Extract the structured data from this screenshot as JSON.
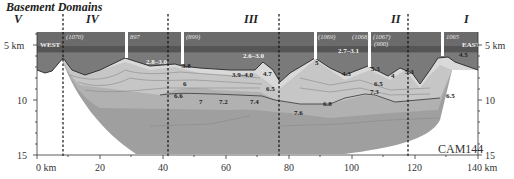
{
  "header": {
    "title": "Basement Domains"
  },
  "domains": [
    {
      "label": "V",
      "x": 18
    },
    {
      "label": "IV",
      "x": 92
    },
    {
      "label": "III",
      "x": 250
    },
    {
      "label": "II",
      "x": 395
    },
    {
      "label": "I",
      "x": 466
    }
  ],
  "boundaries_km": [
    8,
    41,
    76,
    117
  ],
  "side_labels": {
    "west": "WEST",
    "east": "EAST"
  },
  "profile_tag": "CAM144",
  "stations": [
    {
      "label": "(1070)",
      "x_km": 8.5
    },
    {
      "label": "897",
      "x_km": 28
    },
    {
      "label": "(899)",
      "x_km": 46
    },
    {
      "label": "(1069)",
      "x_km": 88
    },
    {
      "label": "(1068)",
      "x_km": 100
    },
    {
      "label": "(1067)",
      "x_km": 108
    },
    {
      "label": "(900)",
      "x_km": 108
    },
    {
      "label": "1065",
      "x_km": 128
    }
  ],
  "velocity_labels": [
    {
      "text": "2.8–3.0",
      "x": 146,
      "y": 64,
      "light": true
    },
    {
      "text": "2.6–3.0",
      "x": 243,
      "y": 58,
      "light": true
    },
    {
      "text": "2.7–3.1",
      "x": 338,
      "y": 53,
      "light": true
    },
    {
      "text": "3.8",
      "x": 182,
      "y": 68
    },
    {
      "text": "3.9–4.0",
      "x": 232,
      "y": 77
    },
    {
      "text": "4.7",
      "x": 263,
      "y": 76
    },
    {
      "text": "5",
      "x": 315,
      "y": 65
    },
    {
      "text": "4.3",
      "x": 342,
      "y": 76
    },
    {
      "text": "5.3",
      "x": 371,
      "y": 71
    },
    {
      "text": "4",
      "x": 391,
      "y": 78
    },
    {
      "text": "5.3",
      "x": 405,
      "y": 74
    },
    {
      "text": "4.5",
      "x": 459,
      "y": 57
    },
    {
      "text": "6",
      "x": 183,
      "y": 86
    },
    {
      "text": "6.6",
      "x": 174,
      "y": 98
    },
    {
      "text": "7",
      "x": 199,
      "y": 104
    },
    {
      "text": "7.2",
      "x": 219,
      "y": 104
    },
    {
      "text": "7.4",
      "x": 250,
      "y": 104
    },
    {
      "text": "6.5",
      "x": 266,
      "y": 91
    },
    {
      "text": "6.5",
      "x": 374,
      "y": 86
    },
    {
      "text": "7.3",
      "x": 370,
      "y": 94
    },
    {
      "text": "6.8",
      "x": 323,
      "y": 106
    },
    {
      "text": "7.6",
      "x": 294,
      "y": 115
    },
    {
      "text": "6.5",
      "x": 446,
      "y": 98
    }
  ],
  "axes": {
    "y_ticks": [
      {
        "label": "5 km",
        "value": 5
      },
      {
        "label": "10",
        "value": 10
      },
      {
        "label": "15",
        "value": 15
      }
    ],
    "x_ticks": [
      {
        "label": "0 km",
        "value": 0
      },
      {
        "label": "20",
        "value": 20
      },
      {
        "label": "40",
        "value": 40
      },
      {
        "label": "60",
        "value": 60
      },
      {
        "label": "80",
        "value": 80
      },
      {
        "label": "100",
        "value": 100
      },
      {
        "label": "120",
        "value": 120
      },
      {
        "label": "140 km",
        "value": 140
      }
    ]
  },
  "colors": {
    "upper_layer": "#6e6e6e",
    "upper_band": "#585858",
    "sediment_mid": "#8c8c8c",
    "crust_light": "#d8d8d8",
    "crust_mid": "#c4c4c4",
    "lower_crust": "#a9a9a9",
    "lower_crust_deep": "#9c9c9c"
  }
}
